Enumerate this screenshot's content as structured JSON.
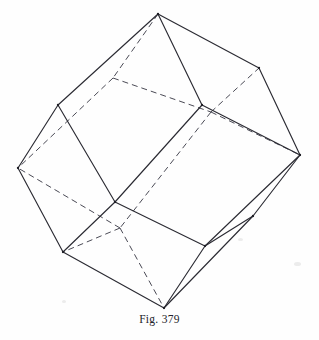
{
  "figure": {
    "caption": "Fig. 379",
    "shape_name": "rhombic dodecahedron",
    "ink_color": "#2b2b33",
    "hidden_edge_color": "#4a4a55",
    "background_color": "#fefefe",
    "canvas": {
      "width": 319,
      "height": 340
    },
    "vertices": {
      "top": [
        158,
        14
      ],
      "upper_left": [
        58,
        105
      ],
      "upper_right": [
        259,
        68
      ],
      "left": [
        18,
        168
      ],
      "right": [
        300,
        155
      ],
      "bottom": [
        164,
        308
      ],
      "lower_left": [
        63,
        252
      ],
      "lower_right": [
        253,
        216
      ],
      "front_center": [
        202,
        105
      ],
      "front_lower": [
        115,
        202
      ],
      "front_right": [
        205,
        246
      ],
      "hidden_top": [
        113,
        78
      ],
      "hidden_center": [
        211,
        112
      ],
      "hidden_lower": [
        120,
        228
      ]
    },
    "visible_edges": [
      [
        "top",
        "upper_left"
      ],
      [
        "top",
        "upper_right"
      ],
      [
        "top",
        "front_center"
      ],
      [
        "upper_left",
        "left"
      ],
      [
        "upper_left",
        "front_lower"
      ],
      [
        "upper_right",
        "right"
      ],
      [
        "left",
        "lower_left"
      ],
      [
        "right",
        "lower_right"
      ],
      [
        "lower_left",
        "bottom"
      ],
      [
        "bottom",
        "front_right"
      ],
      [
        "bottom",
        "lower_right"
      ],
      [
        "front_center",
        "right"
      ],
      [
        "front_center",
        "front_lower"
      ],
      [
        "front_lower",
        "lower_left"
      ],
      [
        "front_lower",
        "front_right"
      ],
      [
        "front_right",
        "lower_right"
      ],
      [
        "front_right",
        "right"
      ]
    ],
    "hidden_edges": [
      [
        "top",
        "hidden_top"
      ],
      [
        "hidden_top",
        "left"
      ],
      [
        "hidden_top",
        "hidden_center"
      ],
      [
        "hidden_center",
        "upper_right"
      ],
      [
        "hidden_center",
        "right"
      ],
      [
        "hidden_center",
        "hidden_lower"
      ],
      [
        "hidden_lower",
        "left"
      ],
      [
        "hidden_lower",
        "bottom"
      ],
      [
        "hidden_lower",
        "lower_left"
      ]
    ]
  }
}
